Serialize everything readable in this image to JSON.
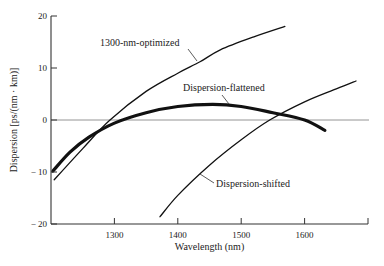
{
  "chart_data": {
    "type": "line",
    "title": "",
    "xlabel": "Wavelength (nm)",
    "ylabel": "Dispersion [ps/(nm · km)]",
    "xlim": [
      1200,
      1700
    ],
    "ylim": [
      -20,
      20
    ],
    "x_ticks": [
      1300,
      1400,
      1500,
      1600
    ],
    "x_tick_labels": [
      "1300",
      "1400",
      "1500",
      "1600"
    ],
    "y_ticks": [
      20,
      10,
      0,
      -10,
      -20
    ],
    "y_tick_labels": [
      "20",
      "10",
      "0",
      "− 10",
      "− 20"
    ],
    "grid": false,
    "legend": "none (curves labeled directly with annotations)",
    "reference_lines": [
      {
        "type": "horizontal",
        "y": 0,
        "label": "zero dispersion"
      }
    ],
    "series": [
      {
        "name": "1300-nm-optimized",
        "style": "thin",
        "x": [
          1205,
          1250,
          1293,
          1350,
          1400,
          1435,
          1467,
          1520,
          1569
        ],
        "y": [
          -11.5,
          -5.5,
          0,
          5.5,
          9.0,
          11.2,
          13.5,
          16.0,
          18.0
        ]
      },
      {
        "name": "Dispersion-flattened",
        "style": "thick",
        "x": [
          1203,
          1230,
          1260,
          1300,
          1350,
          1400,
          1455,
          1500,
          1550,
          1600,
          1632
        ],
        "y": [
          -9.8,
          -6.2,
          -3.3,
          -0.6,
          1.4,
          2.6,
          3.0,
          2.6,
          1.4,
          0.0,
          -2.0
        ]
      },
      {
        "name": "Dispersion-shifted",
        "style": "thin",
        "x": [
          1372,
          1400,
          1450,
          1500,
          1545,
          1600,
          1650,
          1681
        ],
        "y": [
          -18.6,
          -14.5,
          -8.7,
          -3.8,
          0.0,
          3.5,
          6.0,
          7.5
        ]
      }
    ],
    "annotations": [
      {
        "text": "1300-nm-optimized",
        "points_to_series": "1300-nm-optimized"
      },
      {
        "text": "Dispersion-flattened",
        "points_to_series": "Dispersion-flattened"
      },
      {
        "text": "Dispersion-shifted",
        "points_to_series": "Dispersion-shifted"
      }
    ]
  },
  "render": {
    "plot": {
      "left": 51,
      "right": 368,
      "top": 16,
      "bottom": 224
    },
    "colors": {
      "axis": "#333333",
      "curve": "#111111",
      "zero_line": "#888888"
    },
    "annotation_layout": [
      {
        "label_x": 100,
        "label_y": 46,
        "leader": [
          188,
          49,
          197,
          61
        ]
      },
      {
        "label_x": 183,
        "label_y": 91,
        "leader": [
          222,
          95,
          229,
          104
        ]
      },
      {
        "label_x": 216,
        "label_y": 187,
        "leader": [
          200,
          174,
          214,
          183
        ]
      }
    ]
  }
}
